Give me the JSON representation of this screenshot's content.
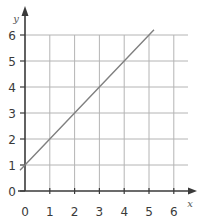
{
  "chart_data": {
    "type": "line",
    "title": "",
    "xlabel": "x",
    "ylabel": "y",
    "xlim": [
      0,
      6
    ],
    "ylim": [
      0,
      6
    ],
    "grid": true,
    "x_ticks": [
      "0",
      "1",
      "2",
      "3",
      "4",
      "5",
      "6"
    ],
    "y_ticks": [
      "0",
      "1",
      "2",
      "3",
      "4",
      "5",
      "6"
    ],
    "series": [
      {
        "name": "y = x + 1",
        "x": [
          -0.2,
          0,
          1,
          2,
          3,
          4,
          5,
          5.2
        ],
        "y": [
          0.8,
          1,
          2,
          3,
          4,
          5,
          6,
          6.2
        ],
        "color": "#808080"
      }
    ]
  },
  "colors": {
    "axis": "#3a3a3a",
    "grid": "#b4b4b4",
    "line": "#808080"
  }
}
